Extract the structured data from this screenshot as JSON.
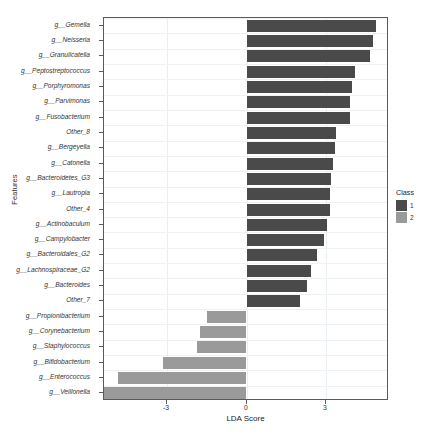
{
  "chart_data": {
    "type": "bar",
    "orientation": "horizontal",
    "title": "",
    "xlabel": "LDA Score",
    "ylabel": "Features",
    "xlim": [
      -5.35,
      5.35
    ],
    "xticks": [
      -3,
      0,
      3
    ],
    "xtick_labels": [
      "-3",
      "0",
      "3"
    ],
    "grid": true,
    "legend": {
      "title": "Class",
      "position": "right",
      "entries": [
        {
          "label": "1",
          "color": "#4a4a4a"
        },
        {
          "label": "2",
          "color": "#9a9a9a"
        }
      ]
    },
    "categories": [
      "g__Gemella",
      "g__Neisseria",
      "g__Granulicatella",
      "g__Peptostreptococcus",
      "g__Porphyromonas",
      "g__Parvimonas",
      "g__Fusobacterium",
      "Other_8",
      "g__Bergeyella",
      "g__Catonella",
      "g__Bacteroidetes_G3",
      "g__Lautropia",
      "Other_4",
      "g__Actinobaculum",
      "g__Campylobacter",
      "g__Bacteroidales_G2",
      "g__Lachnospiraceae_G2",
      "g__Bacteroides",
      "Other_7",
      "g__Propionibacterium",
      "g__Corynebacterium",
      "g__Staphylococcus",
      "g__Bifidobacterium",
      "g__Enterococcus",
      "g__Veillonella"
    ],
    "values": [
      4.87,
      4.75,
      4.63,
      4.09,
      3.97,
      3.89,
      3.89,
      3.35,
      3.31,
      3.23,
      3.19,
      3.15,
      3.12,
      3.02,
      2.92,
      2.65,
      2.42,
      2.26,
      1.99,
      -1.48,
      -1.75,
      -1.87,
      -3.12,
      -4.83,
      -5.34
    ],
    "class_of": [
      1,
      1,
      1,
      1,
      1,
      1,
      1,
      1,
      1,
      1,
      1,
      1,
      1,
      1,
      1,
      1,
      1,
      1,
      1,
      2,
      2,
      2,
      2,
      2,
      2
    ],
    "colors": {
      "class1": "#4a4a4a",
      "class2": "#9a9a9a",
      "axis": "#5a5a5a",
      "grid": "#e9eef2",
      "text": "#333333",
      "background": "#ffffff"
    }
  }
}
